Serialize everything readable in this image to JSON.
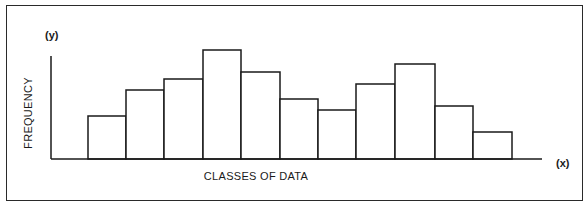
{
  "chart_data": {
    "type": "bar",
    "subtype": "histogram",
    "title": "",
    "xlabel": "CLASSES OF DATA",
    "ylabel": "FREQUENCY",
    "x_axis_symbol": "(x)",
    "y_axis_symbol": "(y)",
    "categories": [
      "1",
      "2",
      "3",
      "4",
      "5",
      "6",
      "7",
      "8",
      "9",
      "10",
      "11"
    ],
    "values": [
      43,
      69,
      80,
      109,
      87,
      60,
      49,
      75,
      95,
      53,
      27
    ],
    "value_units": "relative (no scale shown)",
    "ylim": [
      0,
      115
    ],
    "grid": false,
    "legend": null,
    "bar_fill": "#ffffff",
    "bar_stroke": "#1a1a1a"
  },
  "layout": {
    "baseline_y": 159,
    "bars_x": [
      88,
      126,
      164,
      203,
      241,
      280,
      318,
      356,
      395,
      435,
      473,
      512
    ],
    "yaxis_x": 51,
    "yaxis_top": 56,
    "xaxis_end": 542
  }
}
